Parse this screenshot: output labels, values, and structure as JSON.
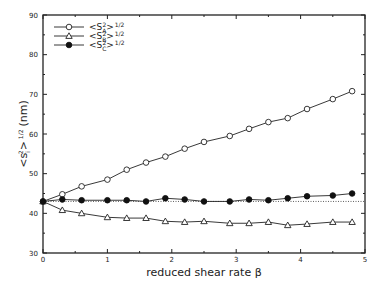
{
  "chart_data": {
    "type": "line",
    "title": "",
    "xlabel": "reduced shear rate β",
    "ylabel": "<s_i^2>^{1/2} (nm)",
    "ylabel_display": {
      "base": "<s",
      "sub": "i",
      "sup1": "2",
      "close": ">",
      "sup2": "1/2",
      "units": "(nm)"
    },
    "xlim": [
      0,
      5
    ],
    "ylim": [
      30,
      90
    ],
    "xticks": [
      0,
      1,
      2,
      3,
      4,
      5
    ],
    "xtick_labels": [
      "0",
      "1",
      "2",
      "3",
      "4",
      "5"
    ],
    "yticks": [
      30,
      40,
      50,
      60,
      70,
      80,
      90
    ],
    "ytick_labels": [
      "30",
      "40",
      "50",
      "60",
      "70",
      "80",
      "90"
    ],
    "grid": false,
    "legend_position": "upper left",
    "reference_line": {
      "y": 43,
      "style": "dotted"
    },
    "series": [
      {
        "name": "<S_A^2>^{1/2}",
        "label": {
          "base": "<S",
          "sub": "A",
          "sup1": "2",
          "close": ">",
          "sup2": "1/2"
        },
        "marker": "open-circle",
        "x": [
          0,
          0.3,
          0.6,
          1.0,
          1.3,
          1.6,
          1.9,
          2.2,
          2.5,
          2.9,
          3.2,
          3.5,
          3.8,
          4.1,
          4.5,
          4.8
        ],
        "values": [
          43.0,
          44.8,
          46.8,
          48.5,
          51.0,
          52.8,
          54.3,
          56.3,
          58.0,
          59.5,
          61.3,
          63.0,
          64.0,
          66.3,
          68.8,
          70.8
        ]
      },
      {
        "name": "<S_B^2>^{1/2}",
        "label": {
          "base": "<S",
          "sub": "B",
          "sup1": "2",
          "close": ">",
          "sup2": "1/2"
        },
        "marker": "open-triangle",
        "x": [
          0,
          0.3,
          0.6,
          1.0,
          1.3,
          1.6,
          1.9,
          2.2,
          2.5,
          2.9,
          3.2,
          3.5,
          3.8,
          4.1,
          4.5,
          4.8
        ],
        "values": [
          43.0,
          40.8,
          40.0,
          39.0,
          38.8,
          38.8,
          38.0,
          37.8,
          38.0,
          37.5,
          37.5,
          37.8,
          37.0,
          37.3,
          37.8,
          37.8
        ]
      },
      {
        "name": "<S_C^2>^{1/2}",
        "label": {
          "base": "<S",
          "sub": "C",
          "sup1": "2",
          "close": ">",
          "sup2": "1/2"
        },
        "marker": "filled-circle",
        "x": [
          0,
          0.3,
          0.6,
          1.0,
          1.3,
          1.6,
          1.9,
          2.2,
          2.5,
          2.9,
          3.2,
          3.5,
          3.8,
          4.1,
          4.5,
          4.8
        ],
        "values": [
          43.0,
          43.5,
          43.3,
          43.3,
          43.3,
          43.0,
          43.8,
          43.5,
          43.0,
          43.0,
          43.5,
          43.3,
          43.8,
          44.3,
          44.5,
          45.0
        ]
      }
    ]
  }
}
